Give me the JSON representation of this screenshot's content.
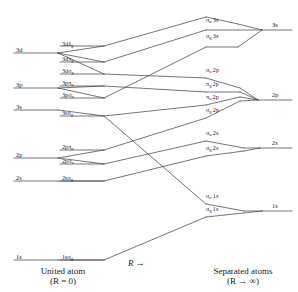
{
  "figure": {
    "type": "correlation-diagram",
    "title": "",
    "captions": {
      "left_line1": "United atom",
      "left_line2": "(R = 0)",
      "middle": "R →",
      "right_line1": "Separated atoms",
      "right_line2": "(R → ∞)"
    },
    "axis_direction_label": "R →"
  },
  "united_atom_levels": [
    {
      "id": "ua-3d",
      "label": "3d",
      "base": "3d",
      "sub": "",
      "y": 47
    },
    {
      "id": "ua-3p",
      "label": "3p",
      "base": "3p",
      "sub": "",
      "y": 82
    },
    {
      "id": "ua-3s",
      "label": "3s",
      "base": "3s",
      "sub": "",
      "y": 104
    },
    {
      "id": "ua-2p",
      "label": "2p",
      "base": "2p",
      "sub": "",
      "y": 152
    },
    {
      "id": "ua-2s",
      "label": "2s",
      "base": "2s",
      "sub": "",
      "y": 175
    },
    {
      "id": "ua-1s",
      "label": "1s",
      "base": "1s",
      "sub": "",
      "y": 254
    }
  ],
  "molecular_orbitals": [
    {
      "id": "mo-3ddg",
      "base": "3dδ",
      "sub": "g",
      "x": 62,
      "y": 41
    },
    {
      "id": "mo-3dpg",
      "base": "3dπ",
      "sub": "g",
      "x": 62,
      "y": 56
    },
    {
      "id": "mo-3dsg",
      "base": "3dσ",
      "sub": "g",
      "x": 62,
      "y": 68
    },
    {
      "id": "mo-3ppu",
      "base": "3pπ",
      "sub": "u",
      "x": 62,
      "y": 80
    },
    {
      "id": "mo-3psu",
      "base": "3pσ",
      "sub": "u",
      "x": 62,
      "y": 92
    },
    {
      "id": "mo-3ssg",
      "base": "3sσ",
      "sub": "g",
      "x": 62,
      "y": 110
    },
    {
      "id": "mo-2ppu",
      "base": "2pπ",
      "sub": "u",
      "x": 62,
      "y": 144
    },
    {
      "id": "mo-2psu",
      "base": "2pσ",
      "sub": "u",
      "x": 62,
      "y": 158
    },
    {
      "id": "mo-2ssg",
      "base": "2sσ",
      "sub": "g",
      "x": 62,
      "y": 175
    },
    {
      "id": "mo-1ssg",
      "base": "1sσ",
      "sub": "g",
      "x": 62,
      "y": 254
    }
  ],
  "separated_atom_orbitals": [
    {
      "id": "sa-su3s",
      "greek": "σ",
      "sub": "u",
      "shell": "3s",
      "x": 206,
      "y": 24
    },
    {
      "id": "sa-sg3s",
      "greek": "σ",
      "sub": "g",
      "shell": "3s",
      "x": 206,
      "y": 41
    },
    {
      "id": "sa-su2p",
      "greek": "σ",
      "sub": "u",
      "shell": "2p",
      "x": 206,
      "y": 72
    },
    {
      "id": "sa-pg2p",
      "greek": "π",
      "sub": "g",
      "shell": "2p",
      "x": 206,
      "y": 86
    },
    {
      "id": "sa-pu2p",
      "greek": "π",
      "sub": "u",
      "shell": "2p",
      "x": 206,
      "y": 99
    },
    {
      "id": "sa-sg2p",
      "greek": "σ",
      "sub": "g",
      "shell": "2p",
      "x": 206,
      "y": 112
    },
    {
      "id": "sa-su2s",
      "greek": "σ",
      "sub": "u",
      "shell": "2s",
      "x": 206,
      "y": 135
    },
    {
      "id": "sa-sg2s",
      "greek": "σ",
      "sub": "g",
      "shell": "2s",
      "x": 206,
      "y": 150
    },
    {
      "id": "sa-su1s",
      "greek": "σ",
      "sub": "u",
      "shell": "1s",
      "x": 206,
      "y": 198
    },
    {
      "id": "sa-sg1s",
      "greek": "σ",
      "sub": "g",
      "shell": "1s",
      "x": 206,
      "y": 211
    }
  ],
  "separated_atom_levels": [
    {
      "id": "sa-3s",
      "label": "3s",
      "x": 272,
      "y": 25
    },
    {
      "id": "sa-2p",
      "label": "2p",
      "x": 272,
      "y": 95
    },
    {
      "id": "sa-2s",
      "label": "2s",
      "x": 272,
      "y": 142
    },
    {
      "id": "sa-1s",
      "label": "1s",
      "x": 272,
      "y": 205
    }
  ],
  "colors": {
    "line": "#3a3a3a",
    "text": "#1a1a1a",
    "background": "#ffffff"
  }
}
